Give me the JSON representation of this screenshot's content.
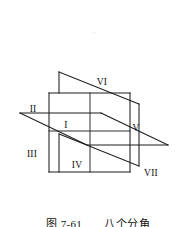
{
  "figure": {
    "caption_number": "图 7-61",
    "caption_gap": "　　",
    "caption_title": "八个分角",
    "ink_color": "#1d1d1d",
    "background_color": "#ffffff",
    "label_color": "#101010"
  },
  "labels": {
    "octant_1": "I",
    "octant_2": "II",
    "octant_3": "III",
    "octant_4": "IV",
    "octant_5": "V",
    "octant_6": "VI",
    "octant_7": "VII"
  },
  "diagram": {
    "type": "technical-line-drawing",
    "planes": [
      {
        "name": "frontal-plane",
        "shape": "rectangle",
        "points": "49,93 130,93 130,172 49,172"
      },
      {
        "name": "horizontal-plane",
        "shape": "parallelogram",
        "points": "20,113 101,113 168,145 87,145"
      },
      {
        "name": "profile-plane",
        "shape": "parallelogram",
        "points": "59,72 140,72 140,178 59,178"
      }
    ],
    "label_positions": {
      "octant_1": [
        66,
        128
      ],
      "octant_2": [
        29,
        112
      ],
      "octant_3": [
        27,
        157
      ],
      "octant_4": [
        71,
        168
      ],
      "octant_5": [
        133,
        131
      ],
      "octant_6": [
        97,
        85
      ],
      "octant_7": [
        146,
        176
      ]
    }
  }
}
